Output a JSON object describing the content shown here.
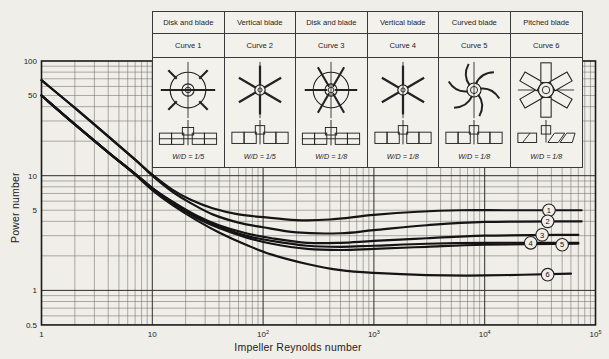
{
  "figure": {
    "xlabel": "Impeller Reynolds number",
    "ylabel": "Power number",
    "x_ticks": [
      {
        "base": "1",
        "sup": "",
        "value": 1
      },
      {
        "base": "10",
        "sup": "",
        "value": 10
      },
      {
        "base": "10",
        "sup": "2",
        "value": 100
      },
      {
        "base": "10",
        "sup": "3",
        "value": 1000
      },
      {
        "base": "10",
        "sup": "4",
        "value": 10000
      },
      {
        "base": "10",
        "sup": "5",
        "value": 100000
      }
    ],
    "y_ticks": [
      {
        "label": "100",
        "value": 100
      },
      {
        "label": "50",
        "value": 50
      },
      {
        "label": "10",
        "value": 10
      },
      {
        "label": "5",
        "value": 5
      },
      {
        "label": "1",
        "value": 1
      },
      {
        "label": "0.5",
        "value": 0.5
      }
    ]
  },
  "legend_table": {
    "columns": [
      {
        "name": "Disk and blade",
        "curve_label": "Curve 1",
        "top_icon": "ic-disk-stub",
        "side_icon": "ic-side-disk",
        "wd_label": "W/D = 1/5"
      },
      {
        "name": "Vertical blade",
        "curve_label": "Curve 2",
        "top_icon": "ic-vertical-blade",
        "side_icon": "ic-side-flat",
        "wd_label": "W/D = 1/5"
      },
      {
        "name": "Disk and blade",
        "curve_label": "Curve 3",
        "top_icon": "ic-disk-spokes",
        "side_icon": "ic-side-disk",
        "wd_label": "W/D = 1/8"
      },
      {
        "name": "Vertical blade",
        "curve_label": "Curve 4",
        "top_icon": "ic-vertical-blade",
        "side_icon": "ic-side-flat",
        "wd_label": "W/D = 1/8"
      },
      {
        "name": "Curved blade",
        "curve_label": "Curve 5",
        "top_icon": "ic-curved-blade",
        "side_icon": "ic-side-flat",
        "wd_label": "W/D = 1/8"
      },
      {
        "name": "Pitched blade",
        "curve_label": "Curve 6",
        "top_icon": "ic-pitched-blade",
        "side_icon": "ic-side-pitched",
        "wd_label": "W/D = 1/8"
      }
    ]
  },
  "chart_data": {
    "type": "line",
    "xlabel": "Impeller Reynolds number",
    "ylabel": "Power number",
    "x_axis": {
      "scale": "log",
      "range": [
        1,
        100000
      ]
    },
    "y_axis": {
      "scale": "log",
      "range": [
        0.5,
        100
      ]
    },
    "grid": "log-log major and minor gridlines",
    "line_color": "#141414",
    "series": [
      {
        "name": "Curve 1 - Disk and blade, W/D = 1/5",
        "marker": "1",
        "marker_at": {
          "re": 38000,
          "np": 5.0
        },
        "re": [
          1,
          2,
          4,
          7,
          10,
          15,
          22,
          35,
          60,
          100,
          200,
          400,
          1000,
          2500,
          6000,
          15000,
          40000,
          75000
        ],
        "np": [
          68,
          39,
          22,
          13.8,
          10.2,
          7.6,
          6.2,
          5.2,
          4.6,
          4.35,
          4.1,
          4.15,
          4.55,
          4.85,
          5.0,
          5.0,
          5.0,
          5.0
        ]
      },
      {
        "name": "Curve 2 - Vertical blade, W/D = 1/5",
        "marker": "2",
        "marker_at": {
          "re": 37000,
          "np": 4.0
        },
        "re": [
          1,
          2,
          4,
          7,
          10,
          15,
          22,
          35,
          60,
          100,
          200,
          500,
          1000,
          3000,
          10000,
          75000
        ],
        "np": [
          68,
          39,
          22,
          13.8,
          10.0,
          7.3,
          5.8,
          4.6,
          3.9,
          3.55,
          3.2,
          3.15,
          3.35,
          3.7,
          3.95,
          4.0
        ]
      },
      {
        "name": "Curve 3 - Disk and blade, W/D = 1/8",
        "marker": "3",
        "marker_at": {
          "re": 33000,
          "np": 3.05
        },
        "re": [
          1,
          2,
          4,
          7,
          10,
          15,
          25,
          40,
          70,
          120,
          250,
          500,
          1000,
          3000,
          10000,
          70000
        ],
        "np": [
          50,
          28,
          16,
          10.4,
          7.8,
          6.0,
          4.5,
          3.7,
          3.15,
          2.85,
          2.6,
          2.6,
          2.7,
          2.85,
          3.0,
          3.05
        ]
      },
      {
        "name": "Curve 4 - Vertical blade, W/D = 1/8",
        "marker": "4",
        "marker_at": {
          "re": 26000,
          "np": 2.6
        },
        "re": [
          1,
          2,
          4,
          7,
          10,
          15,
          25,
          40,
          70,
          120,
          250,
          500,
          1000,
          3000,
          10000,
          70000
        ],
        "np": [
          50,
          28,
          16,
          10.4,
          7.8,
          5.9,
          4.4,
          3.6,
          3.0,
          2.7,
          2.45,
          2.4,
          2.45,
          2.55,
          2.6,
          2.6
        ]
      },
      {
        "name": "Curve 5 - Curved blade, W/D = 1/8",
        "marker": "5",
        "marker_at": {
          "re": 50000,
          "np": 2.5
        },
        "re": [
          1,
          2,
          4,
          7,
          10,
          15,
          25,
          40,
          70,
          120,
          250,
          500,
          1000,
          3000,
          10000,
          70000
        ],
        "np": [
          50,
          28,
          16,
          10.3,
          7.7,
          5.8,
          4.3,
          3.5,
          2.9,
          2.55,
          2.3,
          2.25,
          2.3,
          2.4,
          2.5,
          2.55
        ]
      },
      {
        "name": "Curve 6 - Pitched blade, W/D = 1/8",
        "marker": "6",
        "marker_at": {
          "re": 37000,
          "np": 1.37
        },
        "re": [
          1,
          2,
          4,
          7,
          10,
          15,
          25,
          40,
          70,
          120,
          250,
          500,
          1000,
          3000,
          10000,
          60000
        ],
        "np": [
          50,
          28,
          16,
          10.2,
          7.5,
          5.6,
          4.1,
          3.2,
          2.5,
          2.05,
          1.7,
          1.5,
          1.42,
          1.36,
          1.35,
          1.4
        ]
      }
    ]
  },
  "colors": {
    "paper": "#f0eee9",
    "table_bg": "#f3f1ec",
    "line": "#141414",
    "grid_minor": "#6f6d68",
    "grid_major": "#2e2d2a",
    "frame": "#1a1a19",
    "text": "#222222"
  }
}
